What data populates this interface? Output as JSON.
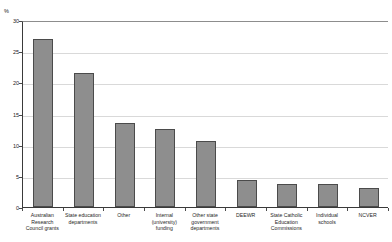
{
  "chart_data": {
    "type": "bar",
    "title": "",
    "xlabel": "",
    "ylabel": "%",
    "ylim": [
      0,
      30
    ],
    "yticks": [
      0,
      5,
      10,
      15,
      20,
      25,
      30
    ],
    "ytick_labels": [
      "0",
      "5",
      "10",
      "15",
      "20",
      "25",
      "30"
    ],
    "grid": true,
    "legend": false,
    "categories": [
      "Australian\nResearch\nCouncil grants",
      "State education\ndepartments",
      "Other",
      "Internal\n(university)\nfunding",
      "Other state\ngovernment\ndepartments",
      "DEEWR",
      "State Catholic\nEducation\nCommissions",
      "Individual\nschools",
      "NCVER"
    ],
    "values": [
      26.9,
      21.5,
      13.5,
      12.5,
      10.6,
      4.4,
      3.7,
      3.7,
      3.0
    ],
    "bar_color": "#8e8e8e",
    "bar_border_color": "#4b4b4b",
    "axis_color": "#3a3a3a",
    "gridline_color": "#d9d9d9"
  },
  "axis": {
    "unit_label": "%"
  },
  "title": {
    "text": ""
  }
}
